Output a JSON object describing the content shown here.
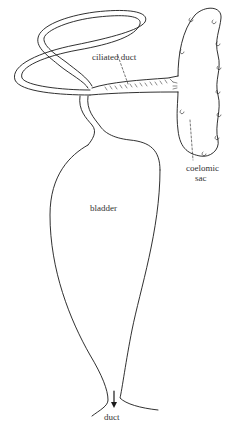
{
  "figure": {
    "labels": {
      "ciliated_duct": "ciliated duct",
      "coelomic_sac": "coelomic",
      "coelomic_sac_line2": "sac",
      "bladder": "bladder",
      "duct": "duct"
    },
    "stroke_color": "#1a1a1a",
    "background": "#ffffff"
  }
}
